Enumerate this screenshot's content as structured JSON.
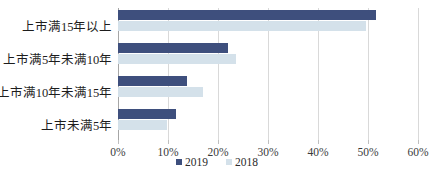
{
  "chart_data": {
    "type": "bar",
    "orientation": "horizontal",
    "title": "",
    "subtitle": "",
    "xlabel": "",
    "ylabel": "",
    "categories": [
      "上市满15年以上",
      "上市满5年未满10年",
      "上市满10年未满15年",
      "上市未满5年"
    ],
    "series": [
      {
        "name": "2019",
        "color": "#3e4f7d",
        "values": [
          51.5,
          22.0,
          13.8,
          11.5
        ]
      },
      {
        "name": "2018",
        "color": "#d4e1ea",
        "values": [
          49.5,
          23.5,
          17.0,
          9.8
        ]
      }
    ],
    "xlim": [
      0,
      60
    ],
    "xtick_values": [
      0,
      10,
      20,
      30,
      40,
      50,
      60
    ],
    "xtick_labels": [
      "0%",
      "10%",
      "20%",
      "30%",
      "40%",
      "50%",
      "60%"
    ],
    "grid": true,
    "grid_axis": "x",
    "legend_position": "bottom",
    "value_suffix": "%"
  },
  "legend": {
    "items": [
      {
        "label": "2019",
        "marker": "square-marker"
      },
      {
        "label": "2018",
        "marker": "square-marker"
      }
    ]
  },
  "colors": {
    "series_2019": "#3e4f7d",
    "series_2018": "#d4e1ea",
    "gridline": "#d9d9d9",
    "axis": "#a6a6a6",
    "background": "#ffffff",
    "text": "#262626"
  }
}
